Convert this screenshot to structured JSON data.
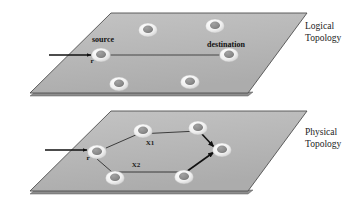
{
  "figure": {
    "title": "",
    "background_color": "#ffffff"
  },
  "planes": [
    {
      "id": "logical",
      "label_line1": "Logical",
      "label_line2": "Topology",
      "fill_color": "#b9b9b9",
      "edge_color": "#4a4a4a",
      "side_color": "#8f8f8f"
    },
    {
      "id": "physical",
      "label_line1": "Physical",
      "label_line2": "Topology",
      "fill_color": "#b9b9b9",
      "edge_color": "#4a4a4a",
      "side_color": "#8f8f8f"
    }
  ],
  "logical": {
    "source_label": "source",
    "destination_label": "destination",
    "ingress_label": "r",
    "node_outer_color": "#f2f2f2",
    "node_inner_color": "#8a8a8a",
    "link_color": "#3a3a3a",
    "nodes": [
      {
        "name": "top-left",
        "x": 148,
        "y": 30
      },
      {
        "name": "top-right",
        "x": 215,
        "y": 26
      },
      {
        "name": "source",
        "x": 101,
        "y": 55
      },
      {
        "name": "destination",
        "x": 229,
        "y": 55
      },
      {
        "name": "bottom-left",
        "x": 119,
        "y": 84
      },
      {
        "name": "bottom-right",
        "x": 190,
        "y": 82
      }
    ],
    "links": [
      {
        "from": "source",
        "to": "destination"
      }
    ]
  },
  "physical": {
    "ingress_label": "r",
    "path_label_upper": "X1",
    "path_label_lower": "X2",
    "node_outer_color": "#f2f2f2",
    "node_inner_color": "#8a8a8a",
    "link_color": "#2e2e2e",
    "nodes": [
      {
        "name": "source",
        "x": 97,
        "y": 152
      },
      {
        "name": "upper-mid",
        "x": 143,
        "y": 131
      },
      {
        "name": "upper-right",
        "x": 198,
        "y": 128
      },
      {
        "name": "destination",
        "x": 222,
        "y": 150
      },
      {
        "name": "lower-left",
        "x": 115,
        "y": 178
      },
      {
        "name": "lower-right",
        "x": 184,
        "y": 177
      }
    ],
    "links": [
      {
        "from": "source",
        "to": "upper-mid"
      },
      {
        "from": "upper-mid",
        "to": "upper-right"
      },
      {
        "from": "upper-right",
        "to": "destination"
      },
      {
        "from": "source",
        "to": "lower-left"
      },
      {
        "from": "lower-left",
        "to": "lower-right"
      },
      {
        "from": "lower-right",
        "to": "destination"
      }
    ]
  }
}
